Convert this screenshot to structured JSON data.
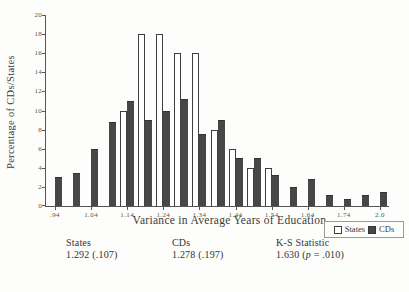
{
  "chart_data": {
    "type": "bar",
    "title": "",
    "xlabel": "Variance in Average Years of Education",
    "ylabel": "Percentage of CDs/States",
    "ylim": [
      0,
      20
    ],
    "yticks": [
      0,
      2,
      4,
      6,
      8,
      10,
      12,
      14,
      16,
      18,
      20
    ],
    "grid": false,
    "legend_position": "bottom-right",
    "xtick_every": 2,
    "categories": [
      ".94",
      ".99",
      "1.04",
      "1.09",
      "1.14",
      "1.19",
      "1.24",
      "1.29",
      "1.34",
      "1.39",
      "1.44",
      "1.49",
      "1.54",
      "1.59",
      "1.64",
      "1.69",
      "1.74",
      "1.79",
      "2.0"
    ],
    "series": [
      {
        "name": "States",
        "fill": "#ffffff",
        "border": "#3e3e3e",
        "values": [
          0,
          0,
          0,
          0,
          10,
          18,
          18,
          16,
          16,
          8,
          6,
          4,
          4,
          0,
          0,
          0,
          0,
          0,
          0
        ]
      },
      {
        "name": "CDs",
        "fill": "#474747",
        "border": "#333333",
        "values": [
          3,
          3.5,
          6,
          8.8,
          11,
          9,
          10,
          11.2,
          7.5,
          9,
          5,
          5,
          3.3,
          2,
          2.8,
          1.2,
          0.7,
          1.2,
          1.5
        ]
      }
    ]
  },
  "stats": {
    "columns": [
      {
        "label": "States",
        "pre": "1.292 (.107)",
        "italic": "",
        "post": ""
      },
      {
        "label": "CDs",
        "pre": "1.278 (.197)",
        "italic": "",
        "post": ""
      },
      {
        "label": "K-S Statistic",
        "pre": "1.630 (",
        "italic": "p",
        "post": " = .010)"
      }
    ]
  },
  "colors": {
    "background": "#fdfdfb",
    "axis": "#555555",
    "ink": "#333333",
    "bar_dark": "#474747",
    "bar_light": "#ffffff"
  }
}
